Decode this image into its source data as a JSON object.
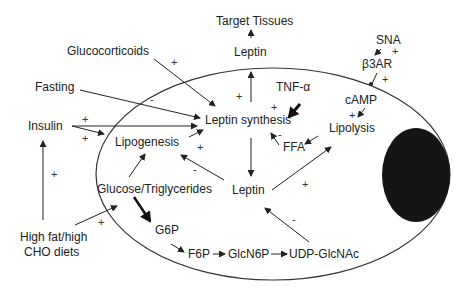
{
  "diagram": {
    "type": "pathway",
    "nodes": {
      "target_tissues": "Target Tissues",
      "leptin_top": "Leptin",
      "glucocorticoids": "Glucocorticoids",
      "sna": "SNA",
      "b3ar": "β3AR",
      "fasting": "Fasting",
      "tnf": "TNF-α",
      "camp": "cAMP",
      "insulin": "Insulin",
      "leptin_synthesis": "Leptin synthesis",
      "lipogenesis": "Lipogenesis",
      "ffa": "FFA",
      "lipolysis": "Lipolysis",
      "glucose": "Glucose/Triglycerides",
      "leptin_mid": "Leptin",
      "diet_line1": "High fat/high",
      "diet_line2": "CHO diets",
      "g6p": "G6P",
      "f6p": "F6P",
      "glcn6p": "GlcN6P",
      "udp": "UDP-GlcNAc"
    },
    "signs": {
      "glucocorticoids": "+",
      "fasting": "-",
      "insulin_synth": "+",
      "insulin_lipo": "+",
      "leptin_export": "+",
      "tnf": "+",
      "ffa": "-",
      "sna": "+",
      "b3ar": "+",
      "camp": "+",
      "lipogenesis_synth": "+",
      "leptin_lipogenesis": "-",
      "leptin_lipolysis": "+",
      "diet_insulin": "+",
      "diet_glucose": "+",
      "udp_leptin": "-"
    },
    "colors": {
      "ink": "#222222",
      "nucleus": "#151515",
      "background": "#ffffff"
    }
  }
}
